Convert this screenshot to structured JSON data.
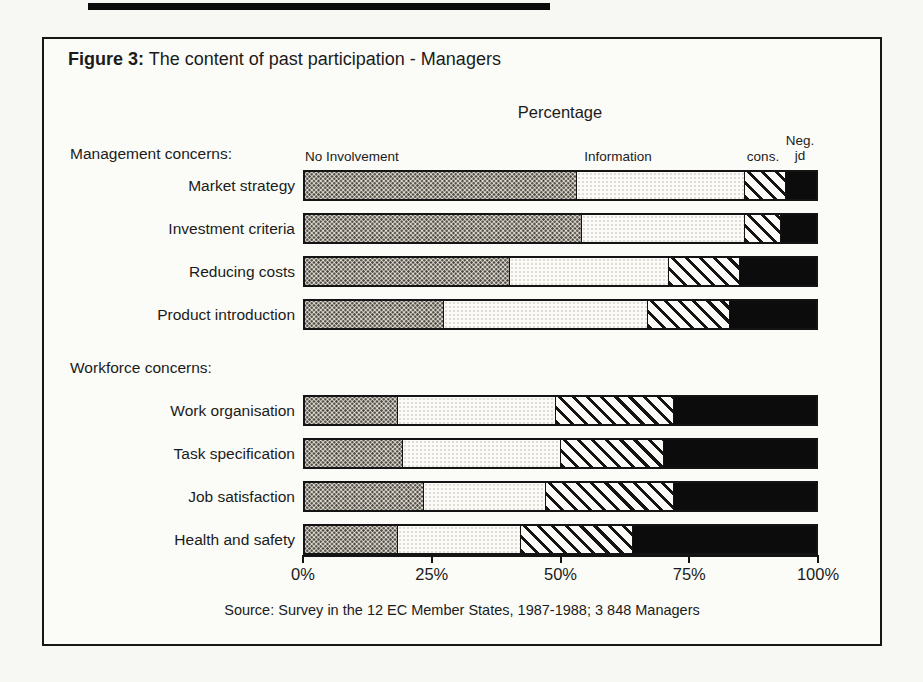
{
  "figure": {
    "label": "Figure 3:",
    "title": "The content of past participation - Managers",
    "axis_title": "Percentage",
    "source": "Source: Survey in the 12 EC Member States, 1987-1988; 3 848 Managers"
  },
  "header_labels": {
    "no_involvement": "No Involvement",
    "information": "Information",
    "consultation": "cons.",
    "negotiation_line1": "Neg.",
    "negotiation_line2": "jd"
  },
  "chart_data": {
    "type": "bar",
    "orientation": "horizontal",
    "stacked": true,
    "unit": "%",
    "xlim": [
      0,
      100
    ],
    "x_ticks": [
      "0%",
      "25%",
      "50%",
      "75%",
      "100%"
    ],
    "axis_title": "Percentage",
    "segment_labels": [
      "No Involvement",
      "Information",
      "cons.",
      "Neg. jd"
    ],
    "segment_keys": [
      "no-involvement",
      "information",
      "consultation",
      "negotiation"
    ],
    "series_styles": [
      "dots",
      "plain",
      "hatch",
      "black"
    ],
    "groups": [
      {
        "label": "Management concerns:",
        "rows": [
          {
            "category": "Market strategy",
            "values": [
              53,
              33,
              8,
              6
            ]
          },
          {
            "category": "Investment criteria",
            "values": [
              54,
              32,
              7,
              7
            ]
          },
          {
            "category": "Reducing costs",
            "values": [
              40,
              31,
              14,
              15
            ]
          },
          {
            "category": "Product introduction",
            "values": [
              27,
              40,
              16,
              17
            ]
          }
        ]
      },
      {
        "label": "Workforce concerns:",
        "rows": [
          {
            "category": "Work organisation",
            "values": [
              18,
              31,
              23,
              28
            ]
          },
          {
            "category": "Task specification",
            "values": [
              19,
              31,
              20,
              30
            ]
          },
          {
            "category": "Job satisfaction",
            "values": [
              23,
              24,
              25,
              28
            ]
          },
          {
            "category": "Health and safety",
            "values": [
              18,
              24,
              22,
              36
            ]
          }
        ]
      }
    ],
    "colors": {
      "ink": "#141414",
      "paper": "#fbfbf8",
      "dot_fill": "#e2dfd8",
      "black_fill": "#0c0c0c"
    }
  }
}
